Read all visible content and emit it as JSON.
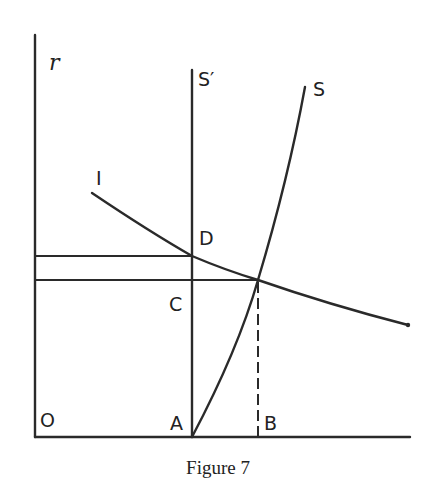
{
  "diagram": {
    "axes": {
      "y_axis_label": "r",
      "origin_label": "O"
    },
    "curves": {
      "investment_curve_label": "I",
      "supply_curve_label": "S",
      "vertical_supply_label": "S′"
    },
    "points": {
      "A": "A",
      "B": "B",
      "C": "C",
      "D": "D"
    },
    "caption": "Figure 7"
  }
}
